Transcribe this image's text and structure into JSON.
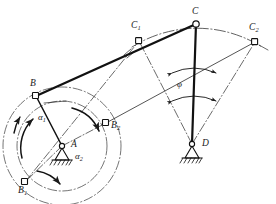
{
  "figure": {
    "type": "mechanism-kinematic-diagram",
    "stroke_color": "#1a1a1a",
    "accent_color": "#000000",
    "background": "#ffffff"
  },
  "labels": {
    "A": {
      "text": "A",
      "sub": ""
    },
    "B": {
      "text": "B",
      "sub": ""
    },
    "B1": {
      "text": "B",
      "sub": "1"
    },
    "B2": {
      "text": "B",
      "sub": "2"
    },
    "C": {
      "text": "C",
      "sub": ""
    },
    "C1": {
      "text": "C",
      "sub": "1"
    },
    "C2": {
      "text": "C",
      "sub": "2"
    },
    "D": {
      "text": "D",
      "sub": ""
    },
    "alpha1": {
      "text": "α",
      "sub": "1"
    },
    "alpha2": {
      "text": "α",
      "sub": "2"
    },
    "phi": {
      "text": "φ",
      "sub": ""
    }
  },
  "joints": [
    {
      "name": "A",
      "kind": "fixed-pivot-ground",
      "x": 62,
      "y": 146
    },
    {
      "name": "B",
      "kind": "revolute-pin",
      "x": 36,
      "y": 96
    },
    {
      "name": "B1",
      "kind": "revolute-pin",
      "x": 25,
      "y": 182
    },
    {
      "name": "B2",
      "kind": "revolute-pin",
      "x": 106,
      "y": 123
    },
    {
      "name": "C",
      "kind": "revolute-pin",
      "x": 196,
      "y": 24
    },
    {
      "name": "C1",
      "kind": "revolute-pin",
      "x": 139,
      "y": 41
    },
    {
      "name": "C2",
      "kind": "revolute-pin",
      "x": 255,
      "y": 42
    },
    {
      "name": "D",
      "kind": "fixed-pivot-ground",
      "x": 192,
      "y": 144
    }
  ],
  "links": [
    {
      "name": "crank-AB",
      "from": "A",
      "to": "B",
      "style": "solid-thin"
    },
    {
      "name": "coupler-BC",
      "from": "B",
      "to": "C",
      "style": "solid-thick"
    },
    {
      "name": "rocker-CD",
      "from": "C",
      "to": "D",
      "style": "solid-thick"
    },
    {
      "name": "crank-AB1",
      "from": "A",
      "to": "B1",
      "style": "dash-dot"
    },
    {
      "name": "crank-AB2",
      "from": "A",
      "to": "B2",
      "style": "dash-dot"
    },
    {
      "name": "coupler-B1C1",
      "from": "B1",
      "to": "C1",
      "style": "dash-dot"
    },
    {
      "name": "coupler-B2C2",
      "from": "B2",
      "to": "C2",
      "style": "solid-thin"
    },
    {
      "name": "rocker-C1D",
      "from": "C1",
      "to": "D",
      "style": "dash-dot"
    },
    {
      "name": "rocker-C2D",
      "from": "C2",
      "to": "D",
      "style": "dash-dot"
    }
  ],
  "arcs": [
    {
      "name": "crank-circle-outer",
      "center": "A",
      "radius": 59,
      "style": "dash-dot",
      "note": "circle through B and B1"
    },
    {
      "name": "crank-circle-inner",
      "center": "A",
      "radius": 45,
      "style": "dash-dot",
      "note": "circle through B2"
    },
    {
      "name": "rocker-arc-C1-C2",
      "center": "D",
      "radius": 122,
      "style": "dash-dot",
      "note": "arc through C1, C and C2"
    }
  ],
  "angles": [
    {
      "name": "alpha1",
      "label": "α1",
      "between": [
        "AB1",
        "AB"
      ],
      "marker": "arc-arrow-ccw"
    },
    {
      "name": "alpha2",
      "label": "α2",
      "between": [
        "AB",
        "AB2"
      ],
      "marker": "arc-arrow-cw"
    },
    {
      "name": "phi",
      "label": "φ",
      "between": [
        "DC1",
        "DC2"
      ],
      "marker": "double-arrow-arc"
    }
  ]
}
